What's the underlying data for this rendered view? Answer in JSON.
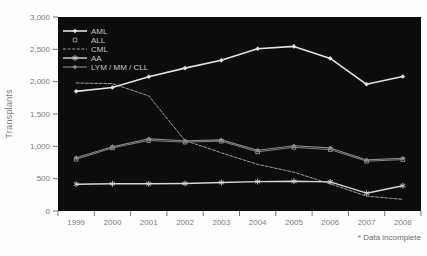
{
  "chart_data": {
    "type": "line",
    "title": "",
    "xlabel": "",
    "ylabel": "Transplants",
    "footnote": "* Data incomplete",
    "x_categories": [
      "1999",
      "2000",
      "2001",
      "2002",
      "2003",
      "2004",
      "2005",
      "2006",
      "2007",
      "2008"
    ],
    "y_tick_labels": [
      "0",
      "500",
      "1,000",
      "1,500",
      "2,000",
      "2,500",
      "3,000"
    ],
    "y_tick_values": [
      0,
      500,
      1000,
      1500,
      2000,
      2500,
      3000
    ],
    "ylim": [
      0,
      3000
    ],
    "grid": false,
    "legend_position": "top-left-inside",
    "plot_background": "#0c0c0c",
    "page_background": "#fdfdfd",
    "axis_text_color": "#7d7d7d",
    "legend_text_color": "#c4c4c4",
    "footnote_color": "#6e6e6e",
    "series": [
      {
        "name": "AML",
        "slug": "aml",
        "color": "#e2e2e2",
        "marker": "filled-diamond",
        "line": "solid",
        "width": 1.6,
        "values": [
          1850,
          1910,
          2075,
          2210,
          2330,
          2510,
          2545,
          2360,
          1960,
          2080
        ]
      },
      {
        "name": "ALL",
        "slug": "all",
        "color": "#909494",
        "marker": "open-square",
        "line": "solid",
        "width": 0.9,
        "values": [
          800,
          975,
          1090,
          1065,
          1080,
          915,
          985,
          950,
          770,
          795
        ]
      },
      {
        "name": "CML",
        "slug": "cml",
        "color": "#9b9b9b",
        "marker": "none",
        "line": "dashed",
        "width": 1.0,
        "values": [
          1980,
          1970,
          1780,
          1090,
          900,
          720,
          600,
          420,
          230,
          180
        ]
      },
      {
        "name": "AA",
        "slug": "aa",
        "color": "#d6d6d6",
        "marker": "asterisk",
        "line": "solid",
        "width": 1.4,
        "values": [
          415,
          420,
          420,
          425,
          440,
          455,
          460,
          450,
          275,
          390
        ]
      },
      {
        "name": "LYM / MM / CLL",
        "slug": "lym-mm-cll",
        "color": "#8a8a8a",
        "marker": "filled-diamond",
        "line": "solid",
        "width": 1.1,
        "values": [
          825,
          995,
          1115,
          1085,
          1100,
          940,
          1010,
          975,
          790,
          815
        ]
      }
    ]
  }
}
